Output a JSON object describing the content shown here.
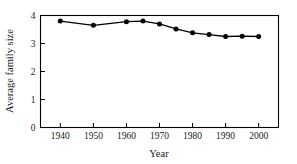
{
  "chart_data": {
    "type": "line",
    "title": "",
    "xlabel": "Year",
    "ylabel": "Average family size",
    "xlim": [
      1934,
      2006
    ],
    "ylim": [
      0,
      4
    ],
    "grid": false,
    "legend": null,
    "xticks": [
      1940,
      1950,
      1960,
      1970,
      1980,
      1990,
      2000
    ],
    "xtick_labels": [
      "1940",
      "1950",
      "1960",
      "1970",
      "1980",
      "1990",
      "2000"
    ],
    "yticks": [
      0,
      1,
      2,
      3,
      4
    ],
    "ytick_labels": [
      "0",
      "1",
      "2",
      "3",
      "4"
    ],
    "marker": "filled-circle",
    "line_color": "#000000",
    "marker_color": "#000000",
    "x": [
      1940,
      1950,
      1960,
      1965,
      1970,
      1975,
      1980,
      1985,
      1990,
      1995,
      2000
    ],
    "values": [
      3.8,
      3.65,
      3.78,
      3.8,
      3.7,
      3.52,
      3.38,
      3.32,
      3.25,
      3.26,
      3.25
    ],
    "series": [
      {
        "name": "Average family size",
        "x": [
          1940,
          1950,
          1960,
          1965,
          1970,
          1975,
          1980,
          1985,
          1990,
          1995,
          2000
        ],
        "values": [
          3.8,
          3.65,
          3.78,
          3.8,
          3.7,
          3.52,
          3.38,
          3.32,
          3.25,
          3.26,
          3.25
        ]
      }
    ]
  },
  "axes": {
    "x_title": "Year",
    "y_title": "Average family size"
  }
}
